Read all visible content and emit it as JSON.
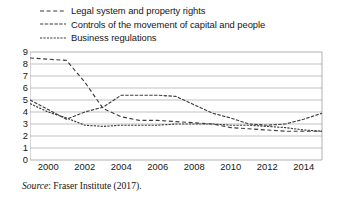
{
  "chart_data": {
    "type": "line",
    "title": "",
    "xlabel": "",
    "ylabel": "",
    "ylim": [
      0,
      9
    ],
    "xlim": [
      1999,
      2015
    ],
    "grid": true,
    "legend_position": "above-plot",
    "y_ticks": [
      "9",
      "8",
      "7",
      "6",
      "5",
      "4",
      "3",
      "2",
      "1",
      "0"
    ],
    "x_ticks": [
      "2000",
      "2002",
      "2004",
      "2006",
      "2008",
      "2010",
      "2012",
      "2014"
    ],
    "x": [
      1999,
      2000,
      2001,
      2002,
      2003,
      2004,
      2005,
      2006,
      2007,
      2008,
      2009,
      2010,
      2011,
      2012,
      2013,
      2014,
      2015
    ],
    "series": [
      {
        "name": "Legal system and property rights",
        "dash": "long-dash",
        "color": "#3d3d3d",
        "values": [
          8.5,
          8.4,
          8.3,
          6.5,
          4.3,
          3.6,
          3.3,
          3.3,
          3.2,
          3.1,
          3.0,
          2.7,
          2.6,
          2.5,
          2.4,
          2.4,
          2.4
        ]
      },
      {
        "name": "Controls of the movement of capital and people",
        "dash": "medium-dash",
        "color": "#3d3d3d",
        "values": [
          5.0,
          4.2,
          3.4,
          4.0,
          4.4,
          5.4,
          5.4,
          5.4,
          5.3,
          4.6,
          3.9,
          3.5,
          3.0,
          2.9,
          3.0,
          3.4,
          3.9
        ]
      },
      {
        "name": "Business regulations",
        "dash": "fine-dash",
        "color": "#3d3d3d",
        "values": [
          4.7,
          4.0,
          3.5,
          2.9,
          2.8,
          2.9,
          2.9,
          2.9,
          3.0,
          3.0,
          3.0,
          2.9,
          2.9,
          2.8,
          2.7,
          2.5,
          2.4
        ]
      }
    ]
  },
  "legend": {
    "items": [
      {
        "label": "Legal system and property rights"
      },
      {
        "label": "Controls of the movement of capital and people"
      },
      {
        "label": "Business regulations"
      }
    ]
  },
  "source": {
    "prefix": "Source",
    "text": ": Fraser Institute (2017)."
  },
  "colors": {
    "line": "#3d3d3d",
    "grid": "#a8a8a8",
    "text": "#161616",
    "background": "#ffffff"
  }
}
